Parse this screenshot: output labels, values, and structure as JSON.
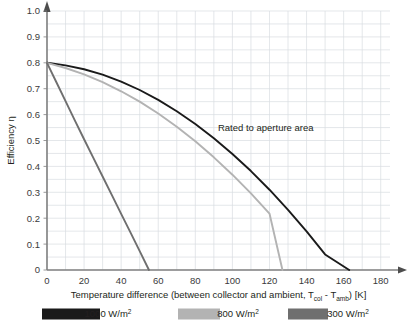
{
  "chart_data": {
    "type": "line",
    "title": "",
    "xlabel": "Temperature difference (between collector and ambient, Tcol - Tamb) [K]",
    "xlabel_parts": {
      "pre": "Temperature difference (between collector and ambient, T",
      "sub1": "col",
      "mid": " - T",
      "sub2": "amb",
      "post": ") [K]"
    },
    "ylabel": "Efficiency η",
    "xlim": [
      0,
      185
    ],
    "ylim": [
      0,
      1.0
    ],
    "xticks": [
      0,
      20,
      40,
      60,
      80,
      100,
      120,
      140,
      160,
      180
    ],
    "yticks": [
      "0",
      "0.1",
      "0.2",
      "0.3",
      "0.4",
      "0.5",
      "0.6",
      "0.7",
      "0.8",
      "0.9",
      "1.0"
    ],
    "ytick_values": [
      0,
      0.1,
      0.2,
      0.3,
      0.4,
      0.5,
      0.6,
      0.7,
      0.8,
      0.9,
      1.0
    ],
    "grid": true,
    "grid_x_step": 10,
    "grid_y_step": 0.05,
    "grid_color": "#d9dde1",
    "axis_color": "#808080",
    "legend_position": "bottom",
    "annotations": [
      {
        "text": "Rated to aperture area",
        "x": 118,
        "y": 0.55
      }
    ],
    "series": [
      {
        "name": "1000 W/m²",
        "color": "#1a1a1a",
        "eta0": 0.8,
        "x_zero": 163,
        "points": [
          [
            0,
            0.8
          ],
          [
            10,
            0.79
          ],
          [
            20,
            0.775
          ],
          [
            30,
            0.754
          ],
          [
            40,
            0.727
          ],
          [
            50,
            0.695
          ],
          [
            60,
            0.657
          ],
          [
            70,
            0.613
          ],
          [
            80,
            0.564
          ],
          [
            90,
            0.509
          ],
          [
            100,
            0.448
          ],
          [
            110,
            0.382
          ],
          [
            120,
            0.31
          ],
          [
            130,
            0.232
          ],
          [
            140,
            0.149
          ],
          [
            150,
            0.06
          ],
          [
            163,
            0.0
          ]
        ]
      },
      {
        "name": "800 W/m²",
        "color": "#b3b3b3",
        "eta0": 0.8,
        "x_zero": 127,
        "points": [
          [
            0,
            0.8
          ],
          [
            10,
            0.78
          ],
          [
            20,
            0.755
          ],
          [
            30,
            0.725
          ],
          [
            40,
            0.69
          ],
          [
            50,
            0.65
          ],
          [
            60,
            0.604
          ],
          [
            70,
            0.553
          ],
          [
            80,
            0.497
          ],
          [
            90,
            0.435
          ],
          [
            100,
            0.368
          ],
          [
            110,
            0.296
          ],
          [
            120,
            0.218
          ],
          [
            127,
            0.0
          ]
        ]
      },
      {
        "name": "300 W/m²",
        "color": "#6f6f6f",
        "eta0": 0.8,
        "x_zero": 55,
        "points": [
          [
            0,
            0.8
          ],
          [
            5,
            0.726
          ],
          [
            10,
            0.652
          ],
          [
            15,
            0.578
          ],
          [
            20,
            0.505
          ],
          [
            25,
            0.433
          ],
          [
            30,
            0.361
          ],
          [
            35,
            0.289
          ],
          [
            40,
            0.217
          ],
          [
            45,
            0.145
          ],
          [
            50,
            0.073
          ],
          [
            55,
            0.0
          ]
        ]
      }
    ]
  },
  "legend": {
    "items": [
      {
        "label_value": "1000",
        "label_unit": "W/m",
        "label_exp": "2",
        "color": "#1a1a1a"
      },
      {
        "label_value": "800",
        "label_unit": "W/m",
        "label_exp": "2",
        "color": "#b3b3b3"
      },
      {
        "label_value": "300",
        "label_unit": "W/m",
        "label_exp": "2",
        "color": "#6f6f6f"
      }
    ]
  },
  "axis": {
    "y_title": "Efficiency η"
  }
}
